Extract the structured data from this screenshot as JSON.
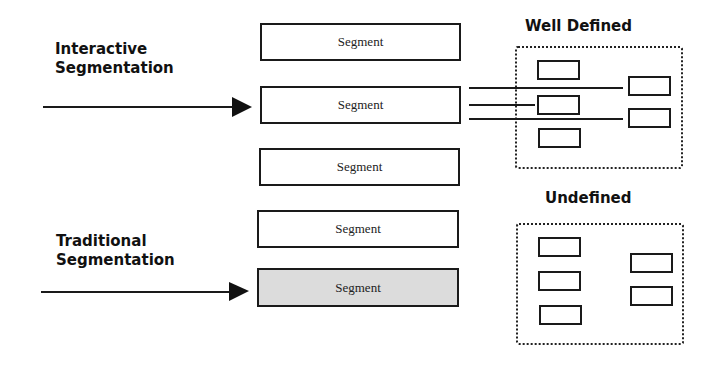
{
  "labels": {
    "interactive": [
      "Interactive",
      "Segmentation"
    ],
    "traditional": [
      "Traditional",
      "Segmentation"
    ],
    "well_defined": "Well Defined",
    "undefined": "Undefined"
  },
  "segments": [
    {
      "label": "Segment",
      "shaded": false
    },
    {
      "label": "Segment",
      "shaded": false
    },
    {
      "label": "Segment",
      "shaded": false
    },
    {
      "label": "Segment",
      "shaded": false
    },
    {
      "label": "Segment",
      "shaded": true
    }
  ],
  "colors": {
    "stroke": "#1a1a1a",
    "shaded_fill": "#dcdcdc",
    "background": "#ffffff"
  }
}
